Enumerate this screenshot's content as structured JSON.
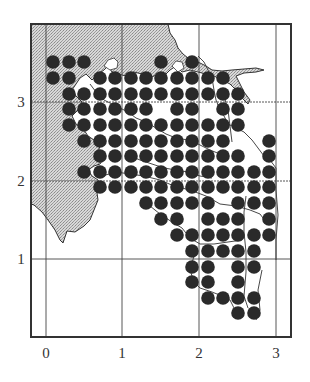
{
  "figure": {
    "frame": {
      "left": 31,
      "top": 24,
      "right": 291,
      "bottom": 337
    },
    "colors": {
      "land": "#c9c9c9",
      "dot": "#2a2a2a",
      "line": "#333333",
      "frame": "#333333",
      "background": "#ffffff"
    },
    "x_axis": {
      "ticks": [
        {
          "label": "0",
          "value": 0,
          "px": 46
        },
        {
          "label": "1",
          "value": 1,
          "px": 122
        },
        {
          "label": "2",
          "value": 2,
          "px": 199
        },
        {
          "label": "3",
          "value": 3,
          "px": 276
        }
      ]
    },
    "y_axis": {
      "ticks": [
        {
          "label": "3",
          "value": 3,
          "px": 102
        },
        {
          "label": "2",
          "value": 2,
          "px": 181
        },
        {
          "label": "1",
          "value": 1,
          "px": 259
        }
      ]
    },
    "dot_grid": {
      "col_px": [
        53,
        69,
        84,
        100,
        115,
        131,
        146,
        161,
        177,
        192,
        208,
        223,
        238,
        254,
        269
      ],
      "row_px": [
        62,
        78,
        94,
        109,
        125,
        141,
        156,
        172,
        187,
        203,
        219,
        235,
        251,
        267,
        282,
        298,
        313
      ],
      "radius": 6.8,
      "rows": [
        [
          0,
          1,
          2,
          7,
          9
        ],
        [
          0,
          1,
          3,
          4,
          5,
          6,
          7,
          8,
          9,
          10,
          11
        ],
        [
          1,
          2,
          3,
          4,
          5,
          6,
          7,
          8,
          9,
          10,
          11,
          12
        ],
        [
          1,
          2,
          3,
          4,
          5,
          6,
          8,
          9,
          11,
          12
        ],
        [
          1,
          2,
          3,
          4,
          5,
          6,
          7,
          8,
          9,
          10,
          11,
          12
        ],
        [
          2,
          3,
          4,
          5,
          6,
          7,
          8,
          9,
          10,
          11,
          14
        ],
        [
          3,
          4,
          5,
          6,
          7,
          8,
          9,
          10,
          11,
          12,
          14
        ],
        [
          2,
          3,
          4,
          5,
          6,
          7,
          8,
          9,
          10,
          11,
          12,
          13,
          14
        ],
        [
          3,
          4,
          5,
          6,
          7,
          8,
          9,
          10,
          11,
          12,
          13,
          14
        ],
        [
          6,
          7,
          8,
          9,
          10,
          12,
          13,
          14
        ],
        [
          7,
          8,
          10,
          11,
          12,
          14
        ],
        [
          8,
          9,
          10,
          11,
          12,
          13,
          14
        ],
        [
          9,
          10,
          11,
          12,
          13
        ],
        [
          9,
          10,
          12,
          13
        ],
        [
          9,
          10,
          12
        ],
        [
          10,
          11,
          12,
          13
        ],
        [
          12,
          13
        ]
      ]
    }
  }
}
